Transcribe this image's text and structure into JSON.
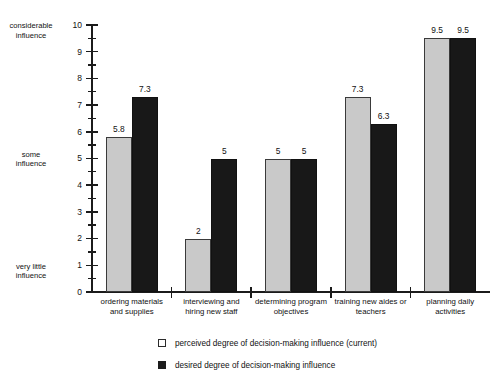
{
  "chart_data": {
    "type": "bar",
    "title": "",
    "subtitle": "",
    "xlabel": "",
    "ylabel": "",
    "ylim": [
      0,
      10
    ],
    "grid": false,
    "legend_position": "bottom",
    "categories": [
      "ordering materials and supplies",
      "interviewing and hiring new staff",
      "determining program objectives",
      "training new aides or teachers",
      "planning daily activities"
    ],
    "category_lines": [
      [
        "ordering materials",
        "and supplies"
      ],
      [
        "interviewing and",
        "hiring new staff"
      ],
      [
        "determining program",
        "objectives"
      ],
      [
        "training new aides or",
        "teachers"
      ],
      [
        "planning daily",
        "activities"
      ]
    ],
    "series": [
      {
        "name": "perceived degree of decision-making influence (current)",
        "color": "#c9c9c9",
        "values": [
          5.8,
          2,
          5,
          7.3,
          9.5
        ],
        "value_labels": [
          "5.8",
          "2",
          "5",
          "7.3",
          "9.5"
        ]
      },
      {
        "name": "desired degree of decision-making influence",
        "color": "#181818",
        "values": [
          7.3,
          5,
          5,
          6.3,
          9.5
        ],
        "value_labels": [
          "7.3",
          "5",
          "5",
          "6.3",
          "9.5"
        ]
      }
    ],
    "yticks_major": [
      "0",
      "1",
      "2",
      "3",
      "4",
      "5",
      "6",
      "7",
      "8",
      "9",
      "10"
    ],
    "ytick_minor_step": 0.5,
    "axis_annotations": [
      {
        "value": 10,
        "lines": [
          "considerable",
          "influence"
        ]
      },
      {
        "value": 5,
        "lines": [
          "some",
          "influence"
        ]
      },
      {
        "value": 0.8,
        "lines": [
          "very little",
          "influence"
        ]
      }
    ]
  },
  "legend": {
    "items": [
      {
        "marker": "open-square-swatch",
        "label": "perceived degree of decision-making influence (current)"
      },
      {
        "marker": "filled-square-swatch",
        "label": "desired degree of decision-making influence"
      }
    ]
  },
  "axis_labels": {
    "considerable_line1": "considerable",
    "considerable_line2": "influence",
    "some_line1": "some",
    "some_line2": "influence",
    "verylittle_line1": "very little",
    "verylittle_line2": "influence"
  }
}
